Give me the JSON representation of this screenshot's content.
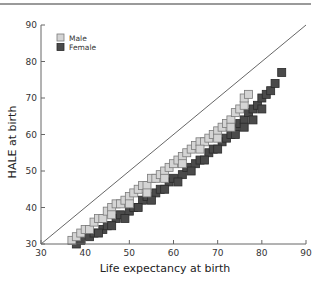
{
  "chart_data": {
    "type": "scatter",
    "title": "",
    "xlabel": "Life expectancy at birth",
    "ylabel": "HALE at birth",
    "xlim": [
      30,
      90
    ],
    "ylim": [
      30,
      90
    ],
    "xticks": [
      30,
      40,
      50,
      60,
      70,
      80,
      90
    ],
    "yticks": [
      30,
      40,
      50,
      60,
      70,
      80,
      90
    ],
    "grid": false,
    "legend_position": "upper-left",
    "reference_line": {
      "type": "diagonal",
      "from": [
        30,
        30
      ],
      "to": [
        90,
        90
      ]
    },
    "series": [
      {
        "name": "Male",
        "color": "#d4d4d4",
        "edge": "#7a7a7a",
        "points": [
          [
            37,
            31
          ],
          [
            38,
            32
          ],
          [
            39,
            33
          ],
          [
            40,
            34
          ],
          [
            41,
            34
          ],
          [
            42,
            36
          ],
          [
            43,
            37
          ],
          [
            44,
            37
          ],
          [
            45,
            39
          ],
          [
            46,
            40
          ],
          [
            47,
            41
          ],
          [
            48,
            41
          ],
          [
            49,
            42
          ],
          [
            50,
            43
          ],
          [
            51,
            44
          ],
          [
            52,
            45
          ],
          [
            53,
            46
          ],
          [
            54,
            46
          ],
          [
            55,
            48
          ],
          [
            56,
            48
          ],
          [
            57,
            49
          ],
          [
            58,
            50
          ],
          [
            59,
            51
          ],
          [
            60,
            52
          ],
          [
            61,
            53
          ],
          [
            62,
            54
          ],
          [
            63,
            55
          ],
          [
            64,
            56
          ],
          [
            65,
            57
          ],
          [
            66,
            58
          ],
          [
            67,
            58
          ],
          [
            68,
            59
          ],
          [
            69,
            60
          ],
          [
            70,
            61
          ],
          [
            71,
            62
          ],
          [
            72,
            63
          ],
          [
            73,
            64
          ],
          [
            74,
            66
          ],
          [
            75,
            67
          ],
          [
            76,
            68
          ],
          [
            76,
            70
          ],
          [
            77,
            71
          ],
          [
            73,
            62
          ],
          [
            70,
            59
          ],
          [
            66,
            56
          ],
          [
            62,
            52
          ],
          [
            58,
            48
          ],
          [
            54,
            44
          ],
          [
            50,
            41
          ],
          [
            46,
            38
          ]
        ]
      },
      {
        "name": "Female",
        "color": "#4a4a4a",
        "edge": "#2a2a2a",
        "points": [
          [
            38,
            30
          ],
          [
            39,
            31
          ],
          [
            41,
            32
          ],
          [
            42,
            33
          ],
          [
            44,
            34
          ],
          [
            45,
            35
          ],
          [
            47,
            37
          ],
          [
            48,
            38
          ],
          [
            50,
            39
          ],
          [
            51,
            40
          ],
          [
            53,
            42
          ],
          [
            54,
            43
          ],
          [
            56,
            44
          ],
          [
            57,
            45
          ],
          [
            59,
            47
          ],
          [
            60,
            48
          ],
          [
            62,
            49
          ],
          [
            63,
            51
          ],
          [
            65,
            52
          ],
          [
            66,
            53
          ],
          [
            68,
            55
          ],
          [
            69,
            56
          ],
          [
            71,
            58
          ],
          [
            72,
            59
          ],
          [
            73,
            60
          ],
          [
            74,
            62
          ],
          [
            75,
            63
          ],
          [
            76,
            64
          ],
          [
            77,
            66
          ],
          [
            78,
            67
          ],
          [
            79,
            68
          ],
          [
            80,
            70
          ],
          [
            81,
            71
          ],
          [
            82,
            72
          ],
          [
            83,
            74
          ],
          [
            84.5,
            77
          ],
          [
            80,
            67
          ],
          [
            78,
            64
          ],
          [
            76,
            62
          ],
          [
            74,
            60
          ],
          [
            70,
            56
          ],
          [
            67,
            53
          ],
          [
            64,
            50
          ],
          [
            61,
            47
          ],
          [
            58,
            45
          ],
          [
            55,
            42
          ],
          [
            52,
            40
          ],
          [
            49,
            37
          ],
          [
            46,
            35
          ],
          [
            43,
            33
          ]
        ]
      }
    ]
  }
}
